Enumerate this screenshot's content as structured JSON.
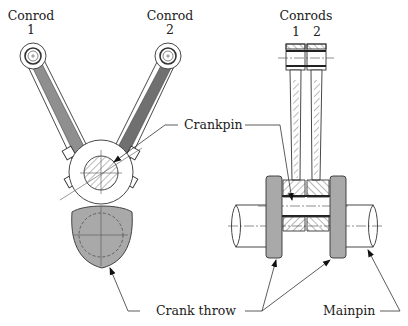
{
  "diagram": {
    "left_view": {
      "conrod_1": {
        "label_line1": "Conrod",
        "label_line2": "1"
      },
      "conrod_2": {
        "label_line1": "Conrod",
        "label_line2": "2"
      }
    },
    "right_view": {
      "conrods_label": "Conrods",
      "conrod_numbers": [
        "1",
        "2"
      ]
    },
    "callouts": {
      "crankpin": "Crankpin",
      "crank_throw": "Crank throw",
      "mainpin": "Mainpin"
    },
    "colors": {
      "rod_fill_light": "#8f8f8f",
      "rod_fill_dark": "#707070",
      "throw_fill": "#a9a9a9",
      "outline": "#333333",
      "background": "#ffffff"
    }
  }
}
